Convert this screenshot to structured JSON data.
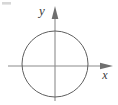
{
  "figure": {
    "name": "circle-on-coordinate-axes",
    "kind": "math-diagram",
    "background_color": "#ffffff",
    "width": 118,
    "height": 105
  },
  "labels": {
    "y_axis": "y",
    "x_axis": "x"
  },
  "axes": {
    "origin": {
      "x": 55,
      "y": 66
    },
    "x_axis": {
      "name": "horizontal-axis",
      "start_x": 8,
      "end_x": 113,
      "y": 66,
      "color": "#8c8c8c",
      "stroke_width": 1.1,
      "arrow_at": "positive-end",
      "label_position": {
        "x": 105,
        "y": 78
      }
    },
    "y_axis": {
      "name": "vertical-axis",
      "x": 55,
      "start_y": 101,
      "end_y": 6,
      "color": "#8c8c8c",
      "stroke_width": 1.1,
      "arrow_at": "positive-end",
      "label_position": {
        "x": 42,
        "y": 15
      }
    },
    "arrowhead": {
      "color": "#6f6f6f",
      "length": 13,
      "half_width": 3.4
    }
  },
  "circle": {
    "name": "unit-circle",
    "center_x": 55,
    "center_y": 64,
    "radius": 33,
    "stroke_color": "#5f5f5f",
    "stroke_width": 1.0,
    "fill": "none",
    "left_edge_x": 22,
    "right_edge_x": 88,
    "top_edge_y": 31,
    "bottom_edge_y": 97
  },
  "artifacts": {
    "corner_smudge": {
      "name": "scan-artifact",
      "x": 2,
      "y": 2,
      "width": 9,
      "height": 3,
      "color": "#c9c9c9",
      "opacity": 0.75
    }
  }
}
